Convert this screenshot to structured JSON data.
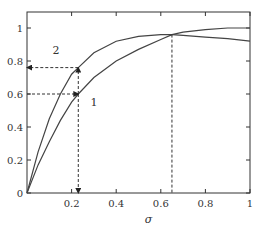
{
  "chart_data": {
    "type": "line",
    "title": "",
    "xlabel": "σ",
    "ylabel": "",
    "xlim": [
      0,
      1
    ],
    "ylim": [
      0,
      1.08
    ],
    "grid": false,
    "x_ticks": [
      "0.2",
      "0.4",
      "0.6",
      "0.8",
      "1"
    ],
    "y_ticks": [
      "0",
      "0.2",
      "0.4",
      "0.6",
      "0.8",
      "1"
    ],
    "series": [
      {
        "name": "1",
        "x": [
          0,
          0.05,
          0.1,
          0.15,
          0.2,
          0.23,
          0.3,
          0.4,
          0.5,
          0.6,
          0.65,
          0.7,
          0.8,
          0.9,
          1.0
        ],
        "values": [
          0,
          0.17,
          0.31,
          0.44,
          0.55,
          0.6,
          0.7,
          0.8,
          0.87,
          0.93,
          0.96,
          0.975,
          0.99,
          1.0,
          1.0
        ]
      },
      {
        "name": "2",
        "x": [
          0,
          0.05,
          0.1,
          0.15,
          0.2,
          0.23,
          0.3,
          0.4,
          0.5,
          0.6,
          0.65,
          0.7,
          0.8,
          0.9,
          1.0
        ],
        "values": [
          0,
          0.25,
          0.45,
          0.6,
          0.72,
          0.76,
          0.85,
          0.92,
          0.95,
          0.96,
          0.96,
          0.955,
          0.945,
          0.935,
          0.92
        ]
      }
    ],
    "annotations": [
      {
        "type": "dashed-arrow",
        "from": [
          0.23,
          0.6
        ],
        "to": [
          0.23,
          0
        ],
        "label": ""
      },
      {
        "type": "dashed-arrow",
        "from": [
          0.23,
          0.6
        ],
        "to": [
          0.23,
          0.76
        ],
        "label": ""
      },
      {
        "type": "dashed-arrow",
        "from": [
          0,
          0.6
        ],
        "to": [
          0.23,
          0.6
        ],
        "label": ""
      },
      {
        "type": "dashed-arrow",
        "from": [
          0.23,
          0.76
        ],
        "to": [
          0,
          0.76
        ],
        "label": ""
      },
      {
        "type": "dashed-line",
        "from": [
          0.65,
          0.96
        ],
        "to": [
          0.65,
          0
        ],
        "label": ""
      }
    ],
    "curve_labels": [
      {
        "text": "2",
        "x": 0.13,
        "y": 0.84
      },
      {
        "text": "1",
        "x": 0.3,
        "y": 0.53
      }
    ]
  }
}
